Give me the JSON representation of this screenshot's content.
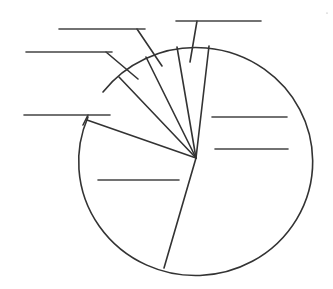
{
  "chart_data": {
    "type": "pie",
    "title": "",
    "style": "blank worksheet pie chart with empty label lines",
    "slices": [
      {
        "label": "",
        "approx_percent": 52,
        "label_position": "inside"
      },
      {
        "label": "",
        "approx_percent": 26,
        "label_position": "inside"
      },
      {
        "label": "",
        "approx_percent": 7,
        "label_position": "leader"
      },
      {
        "label": "",
        "approx_percent": 4,
        "label_position": "leader"
      },
      {
        "label": "",
        "approx_percent": 4,
        "label_position": "leader"
      },
      {
        "label": "",
        "approx_percent": 4,
        "label_position": "leader"
      },
      {
        "label": "",
        "approx_percent": 4,
        "label_position": "leader"
      }
    ],
    "legend": "none",
    "grid": false
  },
  "geometry": {
    "center": [
      196,
      158
    ],
    "rx": 117,
    "ry": 114,
    "spokes": [
      [
        209,
        46
      ],
      [
        177,
        47
      ],
      [
        146,
        57
      ],
      [
        119,
        77
      ],
      [
        87,
        120
      ],
      [
        164,
        268
      ]
    ],
    "blank_lines": [
      {
        "x1": 59,
        "x2": 145,
        "y": 29
      },
      {
        "x1": 26,
        "x2": 112,
        "y": 52
      },
      {
        "x1": 176,
        "x2": 261,
        "y": 21
      },
      {
        "x1": 24,
        "x2": 110,
        "y": 115
      },
      {
        "x1": 212,
        "x2": 287,
        "y": 117
      },
      {
        "x1": 215,
        "x2": 288,
        "y": 149
      },
      {
        "x1": 98,
        "x2": 179,
        "y": 180
      }
    ],
    "leaders": [
      [
        [
          137,
          29
        ],
        [
          162,
          66
        ]
      ],
      [
        [
          106,
          52
        ],
        [
          138,
          79
        ]
      ],
      [
        [
          197,
          21
        ],
        [
          190,
          62
        ]
      ],
      [
        [
          88,
          115
        ],
        [
          83,
          125
        ]
      ]
    ]
  },
  "colors": {
    "line": "#333333",
    "background": "#ffffff"
  }
}
